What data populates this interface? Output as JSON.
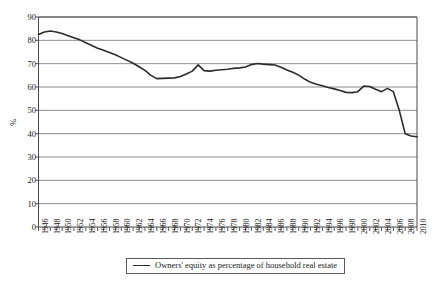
{
  "chart_data": {
    "type": "line",
    "title": "",
    "xlabel": "",
    "ylabel": "%",
    "ylim": [
      0,
      90
    ],
    "ytick_step": 10,
    "yticks": [
      90,
      80,
      70,
      60,
      50,
      40,
      30,
      20,
      10,
      0
    ],
    "grid": "horizontal",
    "legend_position": "bottom-center",
    "series": [
      {
        "name": "Owners' equity as percentage of household real estate",
        "color": "#2b2b2b",
        "x": [
          1946,
          1947,
          1948,
          1949,
          1950,
          1951,
          1952,
          1953,
          1954,
          1955,
          1956,
          1957,
          1958,
          1959,
          1960,
          1961,
          1962,
          1963,
          1964,
          1965,
          1966,
          1967,
          1968,
          1969,
          1970,
          1971,
          1972,
          1973,
          1974,
          1975,
          1976,
          1977,
          1978,
          1979,
          1980,
          1981,
          1982,
          1983,
          1984,
          1985,
          1986,
          1987,
          1988,
          1989,
          1990,
          1991,
          1992,
          1993,
          1994,
          1995,
          1996,
          1997,
          1998,
          1999,
          2000,
          2001,
          2002,
          2003,
          2004,
          2005,
          2006,
          2007,
          2008,
          2009,
          2010
        ],
        "values": [
          82.5,
          83.6,
          84.0,
          83.6,
          82.9,
          82.0,
          81.1,
          80.2,
          79.0,
          77.8,
          76.6,
          75.7,
          74.8,
          73.8,
          72.6,
          71.4,
          70.2,
          68.7,
          67.1,
          65.0,
          63.6,
          63.7,
          63.8,
          63.9,
          64.5,
          65.6,
          66.8,
          69.5,
          67.0,
          66.8,
          67.2,
          67.4,
          67.6,
          68.0,
          68.2,
          68.6,
          69.6,
          70.1,
          69.8,
          69.6,
          69.4,
          68.5,
          67.3,
          66.3,
          65.1,
          63.4,
          62.0,
          61.2,
          60.5,
          59.8,
          59.2,
          58.5,
          57.7,
          57.6,
          58.0,
          60.4,
          60.2,
          59.0,
          58.0,
          59.4,
          58.0,
          50.0,
          40.0,
          39.0,
          38.7
        ]
      }
    ],
    "x_tick_labels": [
      "1946",
      "1948",
      "1950",
      "1952",
      "1954",
      "1956",
      "1958",
      "1960",
      "1962",
      "1964",
      "1966",
      "1968",
      "1970",
      "1972",
      "1974",
      "1976",
      "1978",
      "1980",
      "1982",
      "1984",
      "1986",
      "1988",
      "1990",
      "1992",
      "1994",
      "1996",
      "1998",
      "2000",
      "2002",
      "2004",
      "2006",
      "2008",
      "2010"
    ]
  },
  "legend": {
    "label": "Owners' equity as percentage of household real estate"
  },
  "axes": {
    "y_title": "%"
  }
}
